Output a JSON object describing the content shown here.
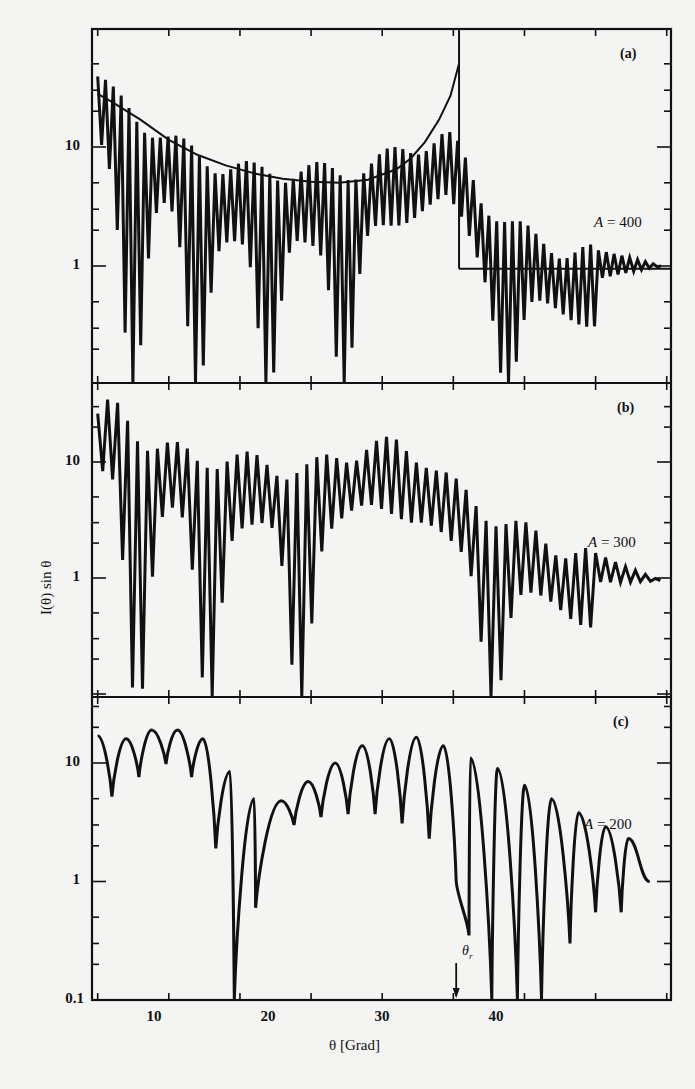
{
  "chart_data": {
    "type": "line",
    "title": "",
    "xlabel": "θ [Grad]",
    "ylabel": "I(θ) sin θ",
    "yscale": "log",
    "xlim": [
      4.6,
      45.3
    ],
    "x_ticks": [
      10,
      20,
      30,
      40
    ],
    "x_minor_ticks": [
      5,
      15,
      25,
      35
    ],
    "grid": false,
    "legend": "none",
    "annotation_theta_r": {
      "label": "θ",
      "sub": "r",
      "x": 30.2
    },
    "panels": [
      {
        "id": "a",
        "panel_label": "(a)",
        "series_label": "A = 400",
        "A_value": "400",
        "y_ticks": [
          {
            "value": 10,
            "label": "10"
          },
          {
            "value": 1,
            "label": "1"
          }
        ],
        "ylim": [
          0.1,
          55
        ],
        "series": [
          {
            "name": "quantum oscillating cross section A=400",
            "envelope_points": [
              [
                5.0,
                30
              ],
              [
                6.0,
                22
              ],
              [
                8.0,
                14
              ],
              [
                10.0,
                9
              ],
              [
                12.0,
                7
              ],
              [
                14.0,
                5.5
              ],
              [
                16.0,
                5
              ],
              [
                18.0,
                5
              ],
              [
                20.0,
                5
              ],
              [
                22.0,
                5
              ],
              [
                24.0,
                5.5
              ],
              [
                26.0,
                7
              ],
              [
                28.0,
                9
              ],
              [
                29.5,
                10
              ],
              [
                30.5,
                7
              ],
              [
                32.0,
                3
              ],
              [
                34.0,
                1.8
              ],
              [
                36.0,
                1.3
              ],
              [
                38.0,
                1.1
              ],
              [
                40.0,
                1.0
              ],
              [
                42.0,
                1.0
              ],
              [
                44.5,
                1.0
              ]
            ],
            "fast_period_deg": 0.55,
            "slow_minima_deg": [
              7.5,
              12.0,
              17.0,
              22.3,
              33.8
            ],
            "deep_minima_min": 0.12
          },
          {
            "name": "classical cross section (smooth)",
            "points": [
              [
                5.0,
                28
              ],
              [
                6,
                24
              ],
              [
                8,
                17
              ],
              [
                10,
                11.5
              ],
              [
                12,
                8.6
              ],
              [
                14,
                7
              ],
              [
                16,
                6
              ],
              [
                18,
                5.4
              ],
              [
                20,
                5.1
              ],
              [
                22,
                5.0
              ],
              [
                24,
                5.3
              ],
              [
                26,
                6.5
              ],
              [
                27,
                8
              ],
              [
                28,
                11
              ],
              [
                29,
                17
              ],
              [
                29.8,
                27
              ],
              [
                30.4,
                50
              ]
            ],
            "rainbow_angle_deg": 30.4,
            "after_rainbow_level": 0.95
          }
        ]
      },
      {
        "id": "b",
        "panel_label": "(b)",
        "series_label": "A = 300",
        "A_value": "300",
        "y_ticks": [
          {
            "value": 10,
            "label": "10"
          },
          {
            "value": 1,
            "label": "1"
          }
        ],
        "ylim": [
          0.1,
          40
        ],
        "series": [
          {
            "name": "quantum oscillating cross section A=300",
            "envelope_points": [
              [
                5.0,
                20
              ],
              [
                6.0,
                25
              ],
              [
                8.0,
                13
              ],
              [
                10.0,
                11
              ],
              [
                12.0,
                8
              ],
              [
                14.0,
                9
              ],
              [
                16.0,
                8
              ],
              [
                18.0,
                7
              ],
              [
                20.0,
                7
              ],
              [
                22.0,
                9
              ],
              [
                24.0,
                11
              ],
              [
                26.0,
                11
              ],
              [
                28.0,
                9
              ],
              [
                30.0,
                5
              ],
              [
                32.0,
                3.2
              ],
              [
                34.0,
                2.3
              ],
              [
                36.0,
                1.8
              ],
              [
                38.0,
                1.4
              ],
              [
                40.0,
                1.2
              ],
              [
                42.0,
                1.05
              ],
              [
                44.5,
                0.95
              ]
            ],
            "fast_period_deg": 0.7,
            "slow_minima_deg": [
              7.8,
              12.8,
              19.2,
              32.8
            ],
            "deep_minima_min": 0.1
          }
        ]
      },
      {
        "id": "c",
        "panel_label": "(c)",
        "series_label": "A = 200",
        "A_value": "200",
        "y_ticks": [
          {
            "value": 10,
            "label": "10"
          },
          {
            "value": 1,
            "label": "1"
          },
          {
            "value": 0.1,
            "label": "0.1"
          }
        ],
        "ylim": [
          0.1,
          30
        ],
        "series": [
          {
            "name": "quantum oscillating cross section A=200",
            "peaks": [
              [
                5.0,
                17
              ],
              [
                7.0,
                16
              ],
              [
                8.8,
                19
              ],
              [
                10.6,
                19
              ],
              [
                12.4,
                16
              ],
              [
                14.3,
                8.5
              ],
              [
                16.0,
                5
              ],
              [
                17.9,
                4.8
              ],
              [
                19.8,
                7
              ],
              [
                21.7,
                10
              ],
              [
                23.6,
                14
              ],
              [
                25.5,
                16
              ],
              [
                27.4,
                16.5
              ],
              [
                29.3,
                14
              ],
              [
                31.2,
                11
              ],
              [
                33.1,
                9
              ],
              [
                35.0,
                6.5
              ],
              [
                36.9,
                5
              ],
              [
                38.8,
                3.8
              ],
              [
                40.7,
                2.9
              ],
              [
                42.3,
                2.3
              ],
              [
                43.8,
                1.0
              ]
            ],
            "troughs": [
              [
                6.0,
                5.2
              ],
              [
                7.9,
                7.6
              ],
              [
                9.8,
                9.8
              ],
              [
                11.6,
                7.6
              ],
              [
                13.3,
                1.9
              ],
              [
                14.6,
                0.1
              ],
              [
                16.1,
                0.6
              ],
              [
                18.8,
                3.0
              ],
              [
                20.7,
                3.5
              ],
              [
                22.6,
                3.7
              ],
              [
                24.5,
                3.7
              ],
              [
                26.4,
                3.1
              ],
              [
                28.3,
                2.3
              ],
              [
                30.2,
                1.0
              ],
              [
                31.1,
                0.35
              ],
              [
                32.7,
                0.1
              ],
              [
                34.5,
                0.1
              ],
              [
                36.2,
                0.1
              ],
              [
                38.2,
                0.3
              ],
              [
                40.0,
                0.55
              ],
              [
                41.8,
                0.55
              ],
              [
                43.8,
                1.0
              ]
            ]
          }
        ]
      }
    ]
  },
  "figure": {
    "xlabel": "θ [Grad]",
    "ylabel": "I(θ) sin θ",
    "theta_r_main": "θ",
    "theta_r_sub": "r",
    "x_tick_labels": [
      "10",
      "20",
      "30",
      "40"
    ],
    "panel_a": {
      "label": "(a)",
      "A_var": "A",
      "A_eq": " = 400",
      "ytick_10": "10",
      "ytick_1": "1"
    },
    "panel_b": {
      "label": "(b)",
      "A_var": "A",
      "A_eq": " = 300",
      "ytick_10": "10",
      "ytick_1": "1"
    },
    "panel_c": {
      "label": "(c)",
      "A_var": "A",
      "A_eq": " = 200",
      "ytick_10": "10",
      "ytick_1": "1",
      "ytick_01": "0.1"
    }
  },
  "colors": {
    "ink": "#111111",
    "paper": "#f4f4f2"
  }
}
